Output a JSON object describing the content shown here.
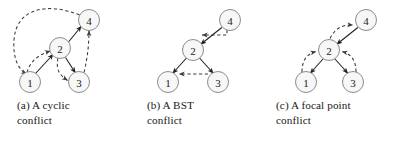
{
  "figure": {
    "node_fill": "#f7f7f7",
    "node_stroke": "#8c8c8c",
    "solid_edge_color": "#222222",
    "dashed_edge_color": "#3a3a3a"
  },
  "panels": [
    {
      "id": "a",
      "caption_line1": "(a) A cyclic",
      "caption_line2": "conflict",
      "nodes": [
        {
          "label": "4",
          "x": 89,
          "y": 20
        },
        {
          "label": "2",
          "x": 60,
          "y": 48
        },
        {
          "label": "1",
          "x": 30,
          "y": 82
        },
        {
          "label": "3",
          "x": 79,
          "y": 82
        }
      ],
      "solid_edges": [
        {
          "from": "1",
          "to": "2"
        },
        {
          "from": "2",
          "to": "4"
        },
        {
          "from": "2",
          "to": "3"
        }
      ],
      "dashed_edges": [
        {
          "from": "4",
          "to": "1"
        },
        {
          "from": "1",
          "to": "2"
        },
        {
          "from": "2",
          "to": "3"
        },
        {
          "from": "3",
          "to": "4"
        }
      ]
    },
    {
      "id": "b",
      "caption_line1": "(b) A BST",
      "caption_line2": "conflict",
      "nodes": [
        {
          "label": "4",
          "x": 100,
          "y": 20
        },
        {
          "label": "2",
          "x": 63,
          "y": 50
        },
        {
          "label": "1",
          "x": 38,
          "y": 82
        },
        {
          "label": "3",
          "x": 88,
          "y": 82
        }
      ],
      "solid_edges": [
        {
          "from": "4",
          "to": "2"
        },
        {
          "from": "2",
          "to": "1"
        },
        {
          "from": "2",
          "to": "3"
        }
      ],
      "dashed_edges": [
        {
          "from": "4",
          "to": "2"
        },
        {
          "from": "3",
          "to": "1"
        }
      ]
    },
    {
      "id": "c",
      "caption_line1": "(c) A focal point",
      "caption_line2": "conflict",
      "nodes": [
        {
          "label": "4",
          "x": 106,
          "y": 20
        },
        {
          "label": "2",
          "x": 69,
          "y": 50
        },
        {
          "label": "1",
          "x": 46,
          "y": 82
        },
        {
          "label": "3",
          "x": 93,
          "y": 82
        }
      ],
      "solid_edges": [
        {
          "from": "4",
          "to": "2"
        },
        {
          "from": "2",
          "to": "1"
        },
        {
          "from": "2",
          "to": "3"
        }
      ],
      "dashed_edges": [
        {
          "from": "2",
          "to": "4"
        },
        {
          "from": "1",
          "to": "2"
        },
        {
          "from": "3",
          "to": "2"
        }
      ]
    }
  ]
}
